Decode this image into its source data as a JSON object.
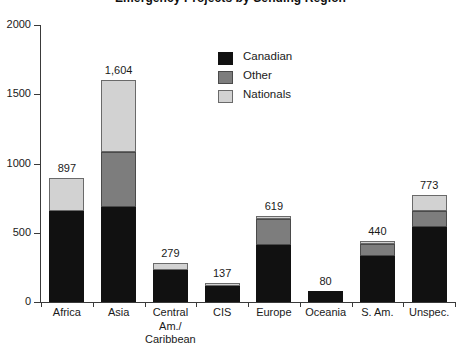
{
  "chart_data": {
    "type": "bar",
    "subtype": "stacked-vertical",
    "title": "Emergency Projects by Sending Region",
    "categories": [
      "Africa",
      "Asia",
      "Central Am./Caribbean",
      "CIS",
      "Europe",
      "Oceania",
      "S. Am.",
      "Unspec."
    ],
    "category_labels_wrapped": [
      [
        "Africa"
      ],
      [
        "Asia"
      ],
      [
        "Central",
        "Am./",
        "Caribbean"
      ],
      [
        "CIS"
      ],
      [
        "Europe"
      ],
      [
        "Oceania"
      ],
      [
        "S. Am."
      ],
      [
        "Unspec."
      ]
    ],
    "series": [
      {
        "name": "Canadian",
        "color": "#111111",
        "values": [
          655,
          685,
          228,
          113,
          410,
          80,
          330,
          540
        ]
      },
      {
        "name": "Other",
        "color": "#7d7d7d",
        "values": [
          0,
          400,
          0,
          0,
          190,
          0,
          90,
          115
        ]
      },
      {
        "name": "Nationals",
        "color": "#d2d2d2",
        "values": [
          242,
          519,
          51,
          24,
          19,
          0,
          20,
          118
        ]
      }
    ],
    "totals": [
      897,
      1604,
      279,
      137,
      619,
      80,
      440,
      773
    ],
    "total_labels": [
      "897",
      "1,604",
      "279",
      "137",
      "619",
      "80",
      "440",
      "773"
    ],
    "ylabel": "",
    "xlabel": "",
    "ylim": [
      0,
      2000
    ],
    "yticks": [
      0,
      500,
      1000,
      1500,
      2000
    ],
    "ytick_labels": [
      "0",
      "500",
      "1000",
      "1500",
      "2000"
    ],
    "grid": false,
    "legend_position": "inside-top-center",
    "legend_entries": [
      "Canadian",
      "Other",
      "Nationals"
    ]
  }
}
